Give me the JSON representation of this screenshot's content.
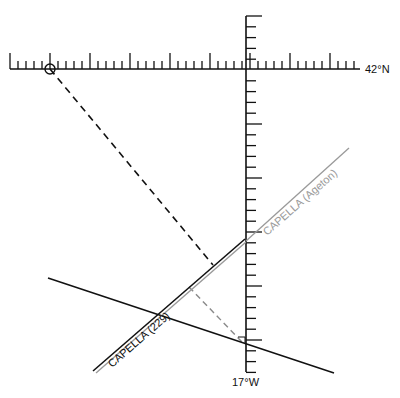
{
  "diagram": {
    "type": "plotting-sheet",
    "horizontal_scale": {
      "label": "42°N",
      "y": 69,
      "x_start": 10,
      "x_end": 360,
      "minor_spacing": 8,
      "major_every": 5,
      "major_origin_x": 50,
      "minor_len": 8,
      "major_len": 16
    },
    "vertical_scale": {
      "label": "17°W",
      "x": 246,
      "y_start": 16,
      "y_end": 372,
      "minor_spacing": 10.8,
      "major_every": 5,
      "major_origin_y": 16,
      "minor_len": 10,
      "major_len": 16
    },
    "assumed_position_marker": {
      "name": "assumed-position",
      "x": 50,
      "y": 69,
      "r": 5
    },
    "dr_position_marker": {
      "name": "fix-position",
      "x": 243,
      "y": 341
    },
    "lines": [
      {
        "name": "azimuth-line-dashed",
        "x1": 50,
        "y1": 69,
        "x2": 213,
        "y2": 265,
        "color": "#111111",
        "dash": "7,5",
        "width": 1.6
      },
      {
        "name": "perpendicular-dashed-gray",
        "x1": 189,
        "y1": 287,
        "x2": 242,
        "y2": 342,
        "color": "#8a8a8a",
        "dash": "6,4",
        "width": 1.4
      },
      {
        "name": "line-of-position-other",
        "x1": 48,
        "y1": 278,
        "x2": 334,
        "y2": 373,
        "color": "#111111",
        "dash": "",
        "width": 1.5
      },
      {
        "name": "lop-capella-229-gray",
        "x1": 96,
        "y1": 373,
        "x2": 246,
        "y2": 242,
        "color": "#9a9a9a",
        "dash": "",
        "width": 1.4
      },
      {
        "name": "lop-capella-229-black",
        "x1": 93,
        "y1": 371,
        "x2": 245,
        "y2": 239,
        "color": "#111111",
        "dash": "",
        "width": 1.6
      },
      {
        "name": "lop-capella-ageton",
        "x1": 246,
        "y1": 241,
        "x2": 349,
        "y2": 148,
        "color": "#9a9a9a",
        "dash": "",
        "width": 1.3
      }
    ],
    "labels": {
      "capella_229": {
        "text": "CAPELLA (229)",
        "x": 112,
        "y": 368,
        "angle": -41,
        "color": "#111111"
      },
      "capella_ageton": {
        "text": "CAPELLA (Ageton)",
        "x": 267,
        "y": 236,
        "angle": -41,
        "color": "#9a9a9a"
      },
      "lat": {
        "text": "42°N",
        "x": 365,
        "y": 73
      },
      "lon": {
        "text": "17°W",
        "x": 232,
        "y": 386
      }
    }
  }
}
